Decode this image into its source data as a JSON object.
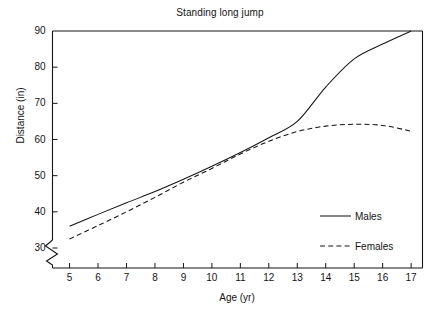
{
  "chart_data": {
    "type": "line",
    "title": "Standing long jump",
    "xlabel": "Age (yr)",
    "ylabel": "Distance (in)",
    "x": [
      5,
      6,
      7,
      8,
      9,
      10,
      11,
      12,
      13,
      14,
      15,
      16,
      17
    ],
    "xticklabels": [
      "5",
      "6",
      "7",
      "8",
      "9",
      "10",
      "11",
      "12",
      "13",
      "14",
      "15",
      "16",
      "17"
    ],
    "yticklabels": [
      "30",
      "40",
      "50",
      "60",
      "70",
      "80",
      "90"
    ],
    "yticks": [
      30,
      40,
      50,
      60,
      70,
      80,
      90
    ],
    "xlim": [
      4.4,
      17.4
    ],
    "ylim": [
      30,
      90
    ],
    "y_axis_break": true,
    "y_axis_break_note": "zigzag break below 30",
    "grid": false,
    "legend_position": "inside lower right",
    "series": [
      {
        "name": "Males",
        "linestyle": "solid",
        "color": "#141414",
        "values": [
          36.0,
          39.3,
          42.5,
          45.6,
          49.0,
          52.6,
          56.4,
          60.5,
          65.0,
          74.5,
          82.3,
          86.4,
          90.0
        ]
      },
      {
        "name": "Females",
        "linestyle": "dashed",
        "color": "#141414",
        "values": [
          32.5,
          36.2,
          40.0,
          44.0,
          48.2,
          52.0,
          56.0,
          59.5,
          62.2,
          63.7,
          64.2,
          63.9,
          62.3
        ]
      }
    ]
  },
  "legend": {
    "entries": [
      {
        "label": "Males",
        "style": "solid"
      },
      {
        "label": "Females",
        "style": "dashed"
      }
    ]
  }
}
